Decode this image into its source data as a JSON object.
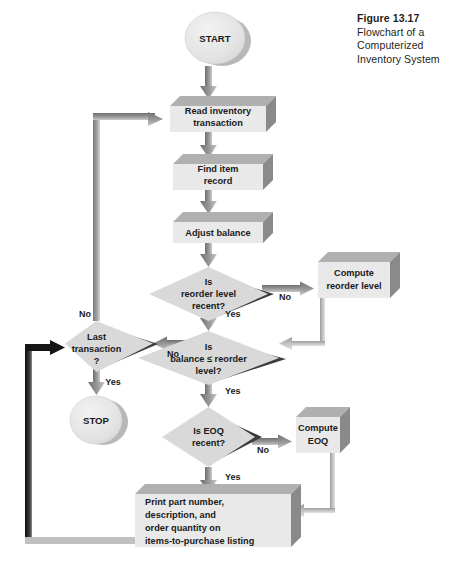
{
  "figure": {
    "number": "Figure 13.17",
    "caption_lines": [
      "Flowchart of a",
      "Computerized",
      "Inventory System"
    ]
  },
  "palette": {
    "face": "#e6e6e6",
    "face_light": "#ededed",
    "top_face": "#b3b3b3",
    "side_face": "#8c8c8c",
    "diamond_face": "#d9d9d9",
    "diamond_shadow": "#3a3a3a",
    "terminal_face": "#e0e0e0",
    "terminal_shadow": "#a8a8a8",
    "arrow_gray": "#808080",
    "arrow_light": "#b0b0b0",
    "arrow_black": "#111111",
    "text": "#1a1a1a",
    "background": "#ffffff"
  },
  "nodes": {
    "start": {
      "id": "start",
      "type": "terminal",
      "label": "START"
    },
    "read_transaction": {
      "id": "read_transaction",
      "type": "process",
      "lines": [
        "Read inventory",
        "transaction"
      ]
    },
    "find_item": {
      "id": "find_item",
      "type": "process",
      "lines": [
        "Find item",
        "record"
      ]
    },
    "adjust_balance": {
      "id": "adjust_balance",
      "type": "process",
      "lines": [
        "Adjust balance"
      ]
    },
    "reorder_recent": {
      "id": "reorder_recent",
      "type": "decision",
      "lines": [
        "Is",
        "reorder level",
        "recent?"
      ]
    },
    "compute_reorder": {
      "id": "compute_reorder",
      "type": "process",
      "lines": [
        "Compute",
        "reorder level"
      ]
    },
    "balance_check": {
      "id": "balance_check",
      "type": "decision",
      "lines": [
        "Is",
        "balance ≤ reorder",
        "level?"
      ]
    },
    "last_transaction": {
      "id": "last_transaction",
      "type": "decision",
      "lines": [
        "Last",
        "transaction",
        "?"
      ]
    },
    "stop": {
      "id": "stop",
      "type": "terminal",
      "label": "STOP"
    },
    "eoq_recent": {
      "id": "eoq_recent",
      "type": "decision",
      "lines": [
        "Is EOQ",
        "recent?"
      ]
    },
    "compute_eoq": {
      "id": "compute_eoq",
      "type": "process",
      "lines": [
        "Compute",
        "EOQ"
      ]
    },
    "print_listing": {
      "id": "print_listing",
      "type": "process",
      "align": "left",
      "lines": [
        "Print part number,",
        "description, and",
        "order quantity on",
        "items-to-purchase listing"
      ]
    }
  },
  "branch_labels": {
    "reorder_no": "No",
    "reorder_yes": "Yes",
    "last_no": "No",
    "last_yes": "Yes",
    "balance_no": "No",
    "balance_yes": "Yes",
    "eoq_no": "No",
    "eoq_yes": "Yes"
  }
}
